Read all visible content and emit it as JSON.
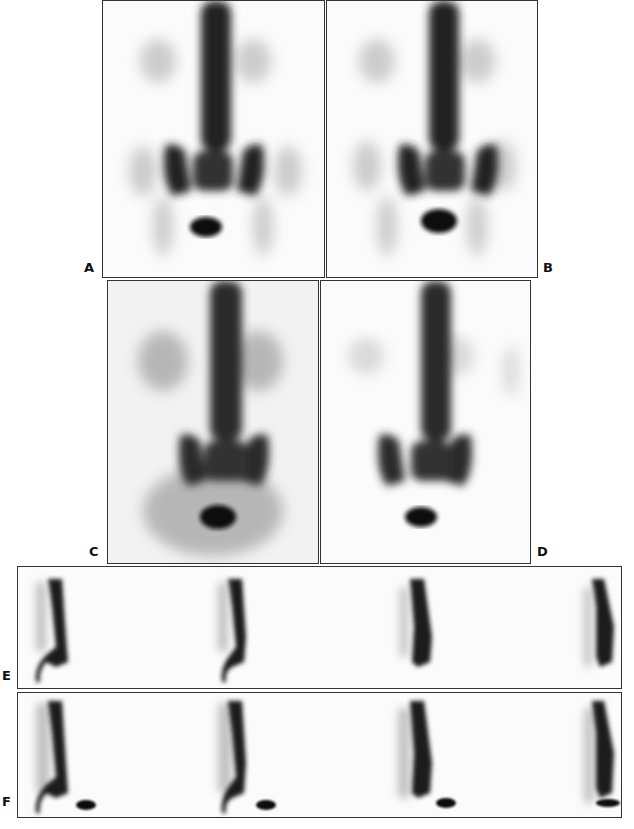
{
  "figure": {
    "panels": [
      {
        "id": "A",
        "label": "A",
        "view": "anterior whole-body spine and pelvis"
      },
      {
        "id": "B",
        "label": "B",
        "view": "anterior whole-body spine and pelvis"
      },
      {
        "id": "C",
        "label": "C",
        "view": "anterior spine and pelvis, higher background"
      },
      {
        "id": "D",
        "label": "D",
        "view": "anterior spine and pelvis"
      },
      {
        "id": "E",
        "label": "E",
        "view": "sagittal spine slices (4)"
      },
      {
        "id": "F",
        "label": "F",
        "view": "sagittal spine slices (4)"
      }
    ]
  },
  "colors": {
    "ink": "#111111",
    "background": "#fbfbfb",
    "border": "#333333"
  }
}
